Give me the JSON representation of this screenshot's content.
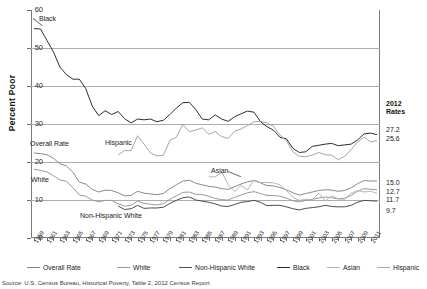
{
  "chart_data": {
    "type": "line",
    "title": "",
    "xlabel": "",
    "ylabel": "Percent Poor",
    "ylim": [
      0,
      60
    ],
    "ytick_labels": [
      "0",
      "10",
      "20",
      "30",
      "40",
      "50",
      "60"
    ],
    "yticks": [
      0,
      10,
      20,
      30,
      40,
      50,
      60
    ],
    "grid": true,
    "legend_position": "bottom",
    "x": [
      1959,
      1960,
      1961,
      1962,
      1963,
      1964,
      1965,
      1966,
      1967,
      1968,
      1969,
      1970,
      1971,
      1972,
      1973,
      1974,
      1975,
      1976,
      1977,
      1978,
      1979,
      1980,
      1981,
      1982,
      1983,
      1984,
      1985,
      1986,
      1987,
      1988,
      1989,
      1990,
      1991,
      1992,
      1993,
      1994,
      1995,
      1996,
      1997,
      1998,
      1999,
      2000,
      2001,
      2002,
      2003,
      2004,
      2005,
      2006,
      2007,
      2008,
      2009,
      2010,
      2011,
      2012
    ],
    "xtick_labels": [
      "1959",
      "1961",
      "1963",
      "1965",
      "1967",
      "1969",
      "1971",
      "1973",
      "1975",
      "1977",
      "1979",
      "1981",
      "1983",
      "1985",
      "1987",
      "1989",
      "1991",
      "1993",
      "1995",
      "1997",
      "1999",
      "2001",
      "2003",
      "2005",
      "2007",
      "2009",
      "2011"
    ],
    "series": [
      {
        "name": "Overall Rate",
        "color": "#8a8a8a",
        "final_rate": "15.0",
        "values": [
          22.4,
          22.2,
          21.9,
          21.0,
          19.5,
          19.0,
          17.3,
          14.7,
          14.2,
          12.8,
          12.1,
          12.6,
          12.5,
          11.9,
          11.1,
          11.2,
          12.3,
          11.8,
          11.6,
          11.4,
          11.7,
          13.0,
          14.0,
          15.0,
          15.2,
          14.4,
          14.0,
          13.6,
          13.4,
          13.0,
          12.8,
          13.5,
          14.2,
          14.8,
          15.1,
          14.5,
          13.8,
          13.7,
          13.3,
          12.7,
          11.9,
          11.3,
          11.7,
          12.1,
          12.5,
          12.7,
          12.6,
          12.3,
          12.5,
          13.2,
          14.3,
          15.1,
          15.0,
          15.0
        ]
      },
      {
        "name": "White",
        "color": "#9a9a9a",
        "final_rate": "12.7",
        "values": [
          18.1,
          17.8,
          17.4,
          16.4,
          15.3,
          14.9,
          13.3,
          11.3,
          11.0,
          10.0,
          9.5,
          9.9,
          9.9,
          9.0,
          8.4,
          8.6,
          9.7,
          9.1,
          8.9,
          8.7,
          9.0,
          10.2,
          11.1,
          12.0,
          12.1,
          11.5,
          11.4,
          11.0,
          10.4,
          10.1,
          10.0,
          10.7,
          11.3,
          11.9,
          12.2,
          11.7,
          11.2,
          11.2,
          11.0,
          10.5,
          9.8,
          9.5,
          9.9,
          10.2,
          10.5,
          10.8,
          10.6,
          10.3,
          10.5,
          11.2,
          12.3,
          13.0,
          12.8,
          12.7
        ]
      },
      {
        "name": "Non-Hispanic White",
        "color": "#4d4d4d",
        "final_rate": "9.7",
        "values": [
          null,
          null,
          null,
          null,
          null,
          null,
          null,
          null,
          null,
          null,
          null,
          null,
          null,
          8.4,
          7.5,
          7.7,
          8.6,
          7.8,
          7.9,
          7.9,
          8.1,
          9.1,
          9.9,
          10.6,
          10.8,
          10.0,
          9.7,
          9.4,
          9.0,
          8.4,
          8.3,
          8.8,
          9.4,
          9.6,
          9.9,
          9.4,
          8.5,
          8.6,
          8.6,
          8.2,
          7.7,
          7.4,
          7.8,
          8.0,
          8.2,
          8.6,
          8.3,
          8.2,
          8.2,
          8.6,
          9.4,
          9.9,
          9.8,
          9.7
        ]
      },
      {
        "name": "Black",
        "color": "#2e2e2e",
        "final_rate": "27.2",
        "values": [
          55.1,
          55.0,
          52.0,
          49.0,
          45.0,
          43.0,
          41.8,
          41.8,
          39.3,
          34.7,
          32.2,
          33.5,
          32.5,
          33.3,
          31.4,
          30.3,
          31.3,
          31.1,
          31.3,
          30.6,
          31.0,
          32.5,
          34.2,
          35.6,
          35.7,
          33.8,
          31.3,
          31.1,
          32.4,
          31.3,
          30.7,
          31.9,
          32.7,
          33.4,
          33.1,
          30.6,
          29.3,
          28.4,
          26.5,
          26.1,
          23.6,
          22.5,
          22.7,
          24.1,
          24.4,
          24.7,
          24.9,
          24.3,
          24.5,
          24.7,
          25.8,
          27.4,
          27.6,
          27.2
        ]
      },
      {
        "name": "Asian",
        "color": "#b4b4b4",
        "final_rate": "11.7",
        "values": [
          null,
          null,
          null,
          null,
          null,
          null,
          null,
          null,
          null,
          null,
          null,
          null,
          null,
          null,
          null,
          null,
          null,
          null,
          null,
          null,
          null,
          null,
          null,
          null,
          null,
          null,
          null,
          16.1,
          16.1,
          17.3,
          14.1,
          12.2,
          13.8,
          12.7,
          15.3,
          14.6,
          14.6,
          14.5,
          14.0,
          12.5,
          10.7,
          9.9,
          10.2,
          10.0,
          11.8,
          9.8,
          11.1,
          10.3,
          10.2,
          11.8,
          12.5,
          12.1,
          12.3,
          11.7
        ]
      },
      {
        "name": "Hispanic",
        "color": "#a6a6a6",
        "final_rate": "25.6",
        "values": [
          null,
          null,
          null,
          null,
          null,
          null,
          null,
          null,
          null,
          null,
          null,
          null,
          null,
          21.9,
          23.0,
          23.0,
          26.9,
          24.7,
          22.4,
          21.6,
          21.8,
          25.7,
          26.5,
          29.9,
          28.0,
          28.4,
          29.0,
          27.3,
          28.0,
          26.7,
          26.2,
          28.1,
          28.7,
          29.6,
          30.6,
          30.7,
          30.3,
          29.4,
          27.1,
          25.6,
          22.7,
          21.5,
          21.4,
          21.8,
          22.5,
          21.9,
          21.8,
          20.6,
          21.5,
          23.2,
          25.3,
          26.5,
          25.3,
          25.6
        ]
      }
    ],
    "rates_panel": {
      "heading_line1": "2012",
      "heading_line2": "Rates",
      "entries": [
        {
          "label": "27.2",
          "series": "Black"
        },
        {
          "label": "25.6",
          "series": "Hispanic"
        },
        {
          "label": "15.0",
          "series": "Overall Rate"
        },
        {
          "label": "12.7",
          "series": "White"
        },
        {
          "label": "11.7",
          "series": "Asian"
        },
        {
          "label": "9.7",
          "series": "Non-Hispanic White"
        }
      ]
    },
    "inline_annotations": [
      {
        "text": "Black",
        "series": "Black"
      },
      {
        "text": "Overall Rate",
        "series": "Overall Rate"
      },
      {
        "text": "Hispanic",
        "series": "Hispanic"
      },
      {
        "text": "White",
        "series": "White"
      },
      {
        "text": "Non-Hispanic White",
        "series": "Non-Hispanic White"
      },
      {
        "text": "Asian",
        "series": "Asian"
      }
    ],
    "legend": [
      {
        "label": "Overall Rate",
        "color": "#8a8a8a"
      },
      {
        "label": "White",
        "color": "#9a9a9a"
      },
      {
        "label": "Non-Hispanic White",
        "color": "#4d4d4d"
      },
      {
        "label": "Black",
        "color": "#2e2e2e"
      },
      {
        "label": "Asian",
        "color": "#b4b4b4"
      },
      {
        "label": "Hispanic",
        "color": "#a6a6a6"
      }
    ],
    "source": "Source: U.S. Census Bureau, Historical Poverty, Table 2, 2012 Census Report"
  }
}
